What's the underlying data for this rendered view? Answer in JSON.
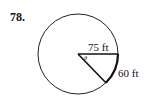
{
  "problem": {
    "number": "78.",
    "radius_label": "75 ft",
    "arc_label": "60 ft",
    "angle_symbol": "θ"
  },
  "figure": {
    "shape": "circle",
    "radius_ft": 75,
    "arc_length_ft": 60,
    "central_angle_rad": 0.8
  }
}
